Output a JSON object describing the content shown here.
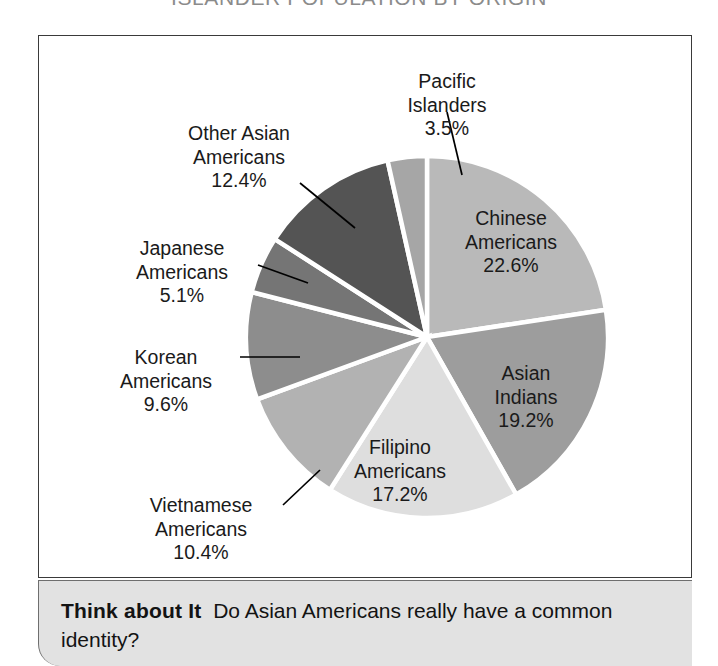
{
  "title": "ISLANDER POPULATION BY ORIGIN",
  "footer": {
    "label": "Think about It",
    "question": "Do Asian Americans really have a common identity?"
  },
  "chart_data": {
    "type": "pie",
    "title": "ISLANDER POPULATION BY ORIGIN",
    "unit": "%",
    "start_angle_deg": 0,
    "direction": "clockwise",
    "legend": "none",
    "labels_placement": "outside-and-inside",
    "categories": [
      "Chinese Americans",
      "Asian Indians",
      "Filipino Americans",
      "Vietnamese Americans",
      "Korean Americans",
      "Japanese Americans",
      "Other Asian Americans",
      "Pacific Islanders"
    ],
    "values": [
      22.6,
      19.2,
      17.2,
      10.4,
      9.6,
      5.1,
      12.4,
      3.5
    ],
    "colors": [
      "#b9b9b9",
      "#9d9d9d",
      "#dedede",
      "#b2b2b2",
      "#8d8d8d",
      "#757575",
      "#545454",
      "#a6a6a6"
    ]
  },
  "slices": [
    {
      "name": "Chinese Americans",
      "line1": "Chinese",
      "line2": "Americans",
      "pct": "22.6%",
      "value": 22.6,
      "color": "#b9b9b9"
    },
    {
      "name": "Asian Indians",
      "line1": "Asian",
      "line2": "Indians",
      "pct": "19.2%",
      "value": 19.2,
      "color": "#9d9d9d"
    },
    {
      "name": "Filipino Americans",
      "line1": "Filipino",
      "line2": "Americans",
      "pct": "17.2%",
      "value": 17.2,
      "color": "#dedede"
    },
    {
      "name": "Vietnamese Americans",
      "line1": "Vietnamese",
      "line2": "Americans",
      "pct": "10.4%",
      "value": 10.4,
      "color": "#b2b2b2"
    },
    {
      "name": "Korean Americans",
      "line1": "Korean",
      "line2": "Americans",
      "pct": "9.6%",
      "value": 9.6,
      "color": "#8d8d8d"
    },
    {
      "name": "Japanese Americans",
      "line1": "Japanese",
      "line2": "Americans",
      "pct": "5.1%",
      "value": 5.1,
      "color": "#757575"
    },
    {
      "name": "Other Asian Americans",
      "line1": "Other Asian",
      "line2": "Americans",
      "pct": "12.4%",
      "value": 12.4,
      "color": "#545454"
    },
    {
      "name": "Pacific Islanders",
      "line1": "Pacific",
      "line2": "Islanders",
      "pct": "3.5%",
      "value": 3.5,
      "color": "#a6a6a6"
    }
  ]
}
